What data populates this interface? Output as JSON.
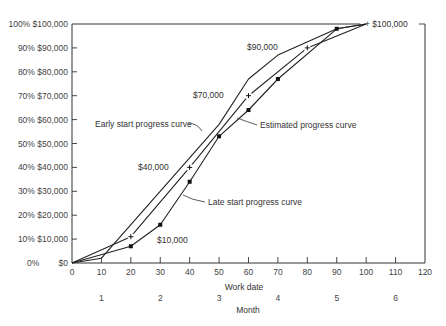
{
  "chart_data": {
    "type": "line",
    "title": "",
    "xlabel": "Work date",
    "xlabel_secondary": "Month",
    "ylabel": "",
    "xlim": [
      0,
      120
    ],
    "ylim": [
      0,
      100
    ],
    "grid": false,
    "legend": "none (curves labeled by annotations)",
    "x_ticks": [
      0,
      10,
      20,
      30,
      40,
      50,
      60,
      70,
      80,
      90,
      100,
      110,
      120
    ],
    "month_ticks": [
      {
        "label": "1",
        "x": 10
      },
      {
        "label": "2",
        "x": 30
      },
      {
        "label": "3",
        "x": 50
      },
      {
        "label": "4",
        "x": 70
      },
      {
        "label": "5",
        "x": 90
      },
      {
        "label": "6",
        "x": 110
      }
    ],
    "y_ticks": [
      {
        "value": 0,
        "pct": "0%",
        "dollars": "$0"
      },
      {
        "value": 10,
        "pct": "10%",
        "dollars": "$10,000"
      },
      {
        "value": 20,
        "pct": "20%",
        "dollars": "$20,000"
      },
      {
        "value": 30,
        "pct": "30%",
        "dollars": "$30,000"
      },
      {
        "value": 40,
        "pct": "40%",
        "dollars": "$40,000"
      },
      {
        "value": 50,
        "pct": "50%",
        "dollars": "$50,000"
      },
      {
        "value": 60,
        "pct": "60%",
        "dollars": "$60,000"
      },
      {
        "value": 70,
        "pct": "70%",
        "dollars": "$70,000"
      },
      {
        "value": 80,
        "pct": "80%",
        "dollars": "$80,000"
      },
      {
        "value": 90,
        "pct": "90%",
        "dollars": "$90,000"
      },
      {
        "value": 100,
        "pct": "100%",
        "dollars": "$100,000"
      }
    ],
    "series": [
      {
        "name": "Early start progress curve",
        "marker": "none",
        "x": [
          0,
          10,
          50,
          60,
          70,
          90,
          100
        ],
        "y": [
          0,
          2,
          58,
          77,
          87,
          98,
          100
        ]
      },
      {
        "name": "Estimated progress curve",
        "marker": "plus",
        "x": [
          0,
          20,
          40,
          60,
          80,
          100
        ],
        "y": [
          0,
          11,
          40,
          70,
          90,
          100
        ]
      },
      {
        "name": "Late start progress curve",
        "marker": "dot",
        "x": [
          0,
          20,
          30,
          40,
          50,
          60,
          70,
          90,
          100
        ],
        "y": [
          0,
          7,
          16,
          34,
          53,
          64,
          77,
          98,
          100
        ]
      }
    ],
    "annotations": [
      {
        "text": "$10,000",
        "x": 29,
        "y": 9
      },
      {
        "text": "$40,000",
        "x": 28,
        "y": 39
      },
      {
        "text": "$70,000",
        "x": 42,
        "y": 69
      },
      {
        "text": "$90,000",
        "x": 63,
        "y": 89
      },
      {
        "text": "+ $100,000",
        "x": 100,
        "y": 100
      },
      {
        "text": "Early start progress curve",
        "x": 7,
        "y": 57
      },
      {
        "text": "Estimated progress curve",
        "x": 63,
        "y": 57
      },
      {
        "text": "Late start progress curve",
        "x": 43,
        "y": 31
      }
    ]
  },
  "labels": {
    "xlabel": "Work date",
    "month_label": "Month",
    "early_label": "Early start progress curve",
    "estimated_label": "Estimated progress curve",
    "late_label": "Late start progress curve",
    "ann_10k": "$10,000",
    "ann_40k": "$40,000",
    "ann_70k": "$70,000",
    "ann_90k": "$90,000",
    "ann_100k": "+ $100,000"
  }
}
